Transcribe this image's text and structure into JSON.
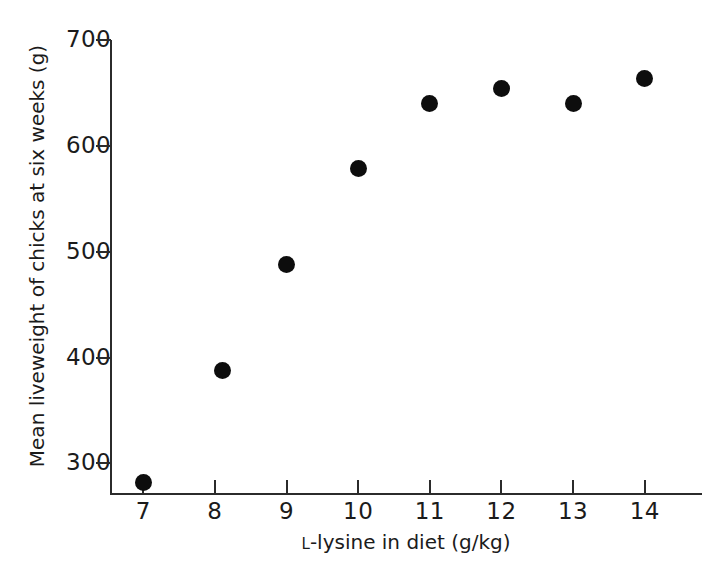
{
  "chart_data": {
    "type": "scatter",
    "title": "",
    "xlabel": "L-lysine in diet (g/kg)",
    "xlabel_prefix": "L",
    "xlabel_rest": "-lysine in diet (g/kg)",
    "ylabel": "Mean liveweight of chicks at six weeks (g)",
    "x": [
      7.0,
      8.1,
      9.0,
      10.0,
      11.0,
      12.0,
      13.0,
      14.0
    ],
    "y": [
      282,
      388,
      488,
      579,
      640,
      654,
      640,
      664
    ],
    "series": [
      {
        "name": "Mean liveweight",
        "points": [
          {
            "x": 7.0,
            "y": 282
          },
          {
            "x": 8.1,
            "y": 388
          },
          {
            "x": 9.0,
            "y": 488
          },
          {
            "x": 10.0,
            "y": 579
          },
          {
            "x": 11.0,
            "y": 640
          },
          {
            "x": 12.0,
            "y": 654
          },
          {
            "x": 13.0,
            "y": 640
          },
          {
            "x": 14.0,
            "y": 664
          }
        ],
        "marker": "filled-circle",
        "color": "#0d0d0d"
      }
    ],
    "xlim": [
      6.55,
      14.8
    ],
    "ylim": [
      272,
      700
    ],
    "xticks": [
      7,
      8,
      9,
      10,
      11,
      12,
      13,
      14
    ],
    "yticks": [
      300,
      400,
      500,
      600,
      700
    ],
    "xtick_labels": [
      "7",
      "8",
      "9",
      "10",
      "11",
      "12",
      "13",
      "14"
    ],
    "ytick_labels": [
      "300",
      "400",
      "500",
      "600",
      "700"
    ],
    "grid": false,
    "legend": false,
    "legend_position": "none",
    "axis_color": "#2b2b2b",
    "background": "#ffffff"
  }
}
